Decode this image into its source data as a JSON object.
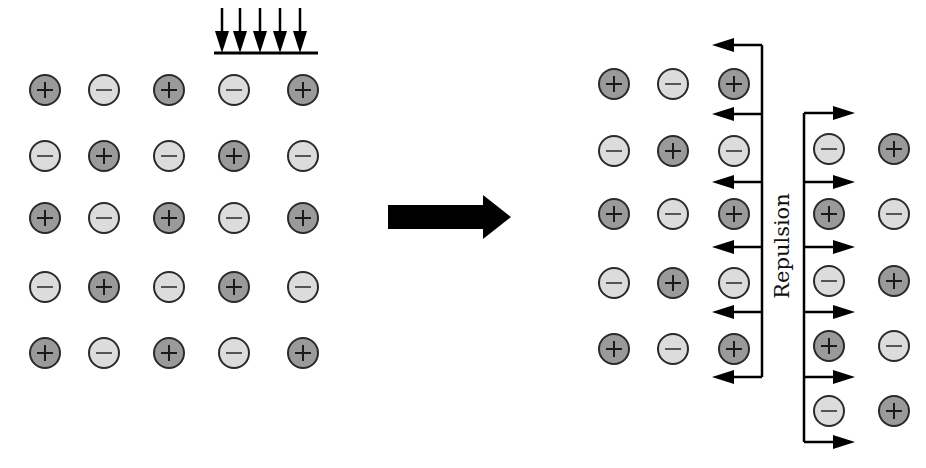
{
  "colors": {
    "cation_fill": "#9a9a9a",
    "anion_fill": "#dcdcdc",
    "outline": "#2a2a2a",
    "arrow": "#000000"
  },
  "legend": {
    "positive_ion": "+",
    "negative_ion": "−"
  },
  "force_label": "Repulsion",
  "left_lattice": {
    "description": "Before stress",
    "columns_x": [
      44,
      103,
      168,
      233,
      302
    ],
    "rows_y": [
      89,
      155,
      217,
      286,
      352
    ],
    "charges": [
      [
        "+",
        "-",
        "+",
        "-",
        "+"
      ],
      [
        "-",
        "+",
        "-",
        "+",
        "-"
      ],
      [
        "+",
        "-",
        "+",
        "-",
        "+"
      ],
      [
        "-",
        "+",
        "-",
        "+",
        "-"
      ],
      [
        "+",
        "-",
        "+",
        "-",
        "+"
      ]
    ]
  },
  "stress_arrows": {
    "count": 5,
    "x": [
      222,
      240,
      260,
      280,
      300
    ],
    "top_y": 8,
    "bar_y": 53,
    "bar_x": [
      214,
      318
    ]
  },
  "transition_arrow": {
    "x1": 388,
    "x2": 511,
    "y": 217
  },
  "right_lattice": {
    "description": "After stress (layers shifted)",
    "left_block": {
      "columns_x": [
        613,
        672,
        733
      ],
      "rows_y": [
        83,
        150,
        213,
        282,
        348
      ],
      "charges": [
        [
          "+",
          "-",
          "+"
        ],
        [
          "-",
          "+",
          "-"
        ],
        [
          "+",
          "-",
          "+"
        ],
        [
          "-",
          "+",
          "-"
        ],
        [
          "+",
          "-",
          "+"
        ]
      ]
    },
    "right_block": {
      "columns_x": [
        828,
        893
      ],
      "rows_y": [
        148,
        213,
        280,
        345,
        410
      ],
      "charges": [
        [
          "-",
          "+"
        ],
        [
          "+",
          "-"
        ],
        [
          "-",
          "+"
        ],
        [
          "+",
          "-"
        ],
        [
          "-",
          "+"
        ]
      ]
    },
    "left_repulsion_arrows": {
      "spine_x": 762,
      "y": [
        45,
        114,
        182,
        247,
        312,
        377
      ],
      "tip_x": 712
    },
    "right_repulsion_arrows": {
      "spine_x": 804,
      "y": [
        113,
        182,
        247,
        312,
        377,
        442
      ],
      "tip_x": 855
    }
  }
}
